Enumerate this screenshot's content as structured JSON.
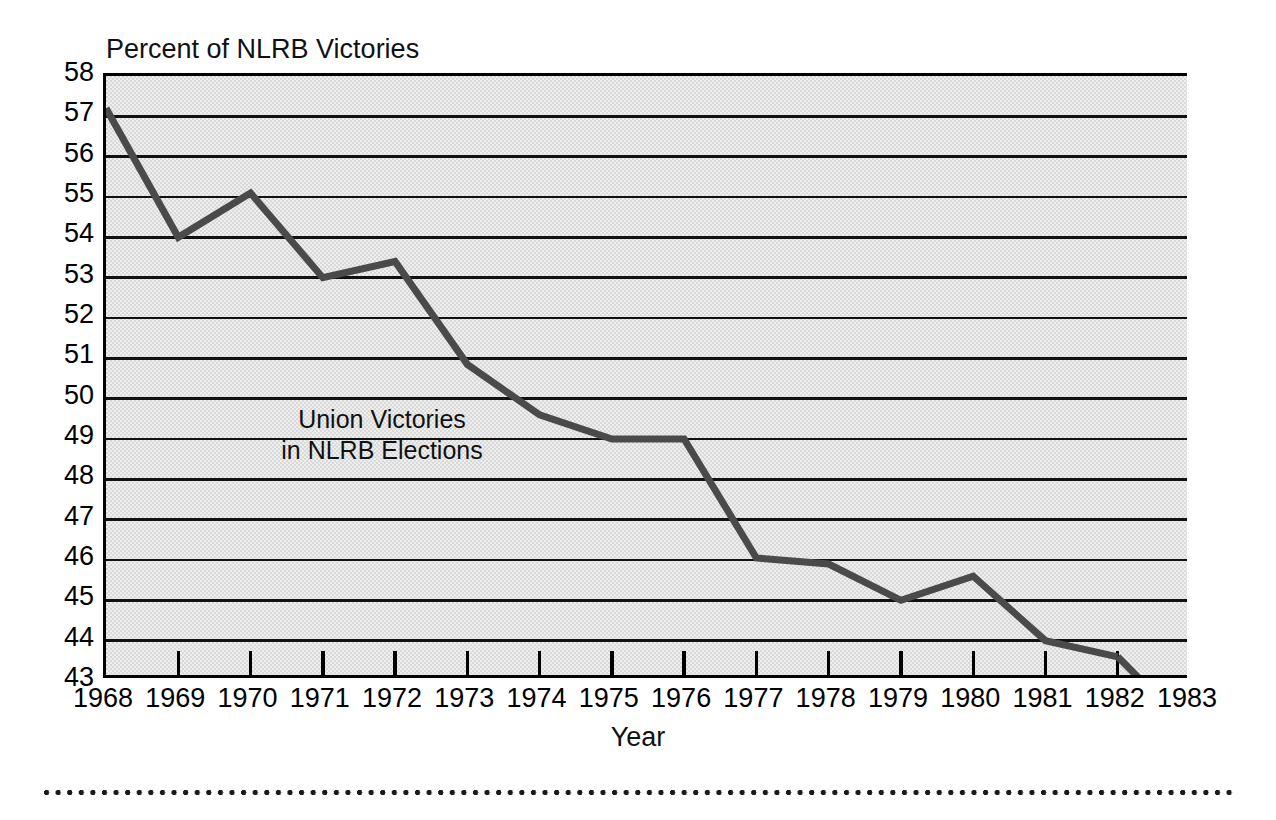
{
  "chart_data": {
    "type": "line",
    "title": "Percent of NLRB Victories",
    "subtitle": "",
    "xlabel": "Year",
    "ylabel": "Percent of NLRB Victories",
    "annotation": {
      "line1": "Union Victories",
      "line2": "in NLRB Elections"
    },
    "legend": [],
    "legend_position": "none",
    "grid": true,
    "grid_axis": "y",
    "xlim": [
      1968,
      1983
    ],
    "ylim": [
      43,
      58
    ],
    "ytick_step": 1,
    "categories": [
      1968,
      1969,
      1970,
      1971,
      1972,
      1973,
      1974,
      1975,
      1976,
      1977,
      1978,
      1979,
      1980,
      1981,
      1982
    ],
    "x": [
      1968,
      1969,
      1970,
      1971,
      1972,
      1973,
      1974,
      1975,
      1976,
      1977,
      1978,
      1979,
      1980,
      1981,
      1982
    ],
    "values": [
      57.2,
      54.0,
      55.1,
      53.0,
      53.4,
      50.85,
      49.6,
      49.0,
      49.0,
      46.05,
      45.9,
      45.0,
      45.6,
      44.0,
      43.6
    ],
    "series": [
      {
        "name": "Union Victories in NLRB Elections",
        "values": [
          57.2,
          54.0,
          55.1,
          53.0,
          53.4,
          50.85,
          49.6,
          49.0,
          49.0,
          46.05,
          45.9,
          45.0,
          45.6,
          44.0,
          43.6
        ],
        "color": "#4a4a4a"
      }
    ],
    "xtick_labels": [
      "1968",
      "1969",
      "1970",
      "1971",
      "1972",
      "1973",
      "1974",
      "1975",
      "1976",
      "1977",
      "1978",
      "1979",
      "1980",
      "1981",
      "1982",
      "1983"
    ],
    "ytick_labels": [
      "58",
      "57",
      "56",
      "55",
      "54",
      "53",
      "52",
      "51",
      "50",
      "49",
      "48",
      "47",
      "46",
      "45",
      "44",
      "43"
    ],
    "colors": {
      "line": "#4a4a4a",
      "plot_background": "#d9d9d9",
      "gridline": "#111111",
      "axis": "#000000",
      "text": "#000000",
      "page_background": "#ffffff"
    }
  }
}
